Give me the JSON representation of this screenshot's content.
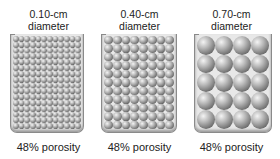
{
  "panels": [
    {
      "size_label": "0.10-cm",
      "diameter_label": "diameter",
      "porosity_label": "48% porosity",
      "cols": 12,
      "rows": 16
    },
    {
      "size_label": "0.40-cm",
      "diameter_label": "diameter",
      "porosity_label": "48% porosity",
      "cols": 8,
      "rows": 11
    },
    {
      "size_label": "0.70-cm",
      "diameter_label": "diameter",
      "porosity_label": "48% porosity",
      "cols": 4,
      "rows": 5
    }
  ],
  "colors": {
    "sphere_highlight": "#f4f4f4",
    "sphere_shadow": "#3e3e3e",
    "container_border": "#8a8a8a",
    "container_fill": "#e8e8e8"
  }
}
